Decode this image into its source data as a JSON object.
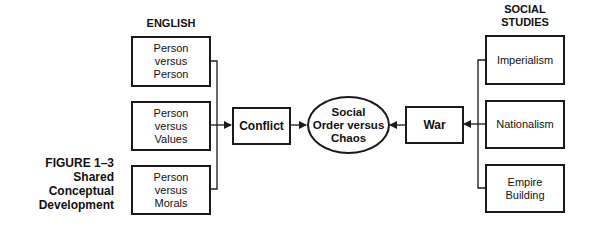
{
  "figure": {
    "caption_number": "FIGURE 1–3",
    "caption_title_line1": "Shared",
    "caption_title_line2": "Conceptual",
    "caption_title_line3": "Development"
  },
  "left_column": {
    "header": "ENGLISH",
    "boxes": [
      {
        "label": "Person\nversus\nPerson"
      },
      {
        "label": "Person\nversus\nValues"
      },
      {
        "label": "Person\nversus\nMorals"
      }
    ]
  },
  "center": {
    "conflict_label": "Conflict",
    "ellipse_label": "Social\nOrder versus\nChaos",
    "war_label": "War"
  },
  "right_column": {
    "header": "SOCIAL\nSTUDIES",
    "boxes": [
      {
        "label": "Imperialism"
      },
      {
        "label": "Nationalism"
      },
      {
        "label": "Empire\nBuilding"
      }
    ]
  },
  "colors": {
    "line": "#1a1a1a",
    "background": "#ffffff"
  }
}
